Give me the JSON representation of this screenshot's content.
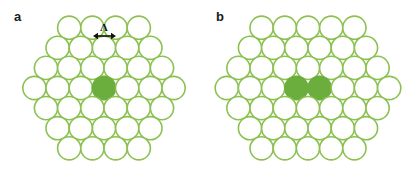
{
  "figure": {
    "background_color": "#ffffff",
    "width": 416,
    "height": 171
  },
  "colors": {
    "circle_outline": "#8CC152",
    "circle_fill_empty": "#ffffff",
    "circle_fill_highlight": "#6CAE3E",
    "label_text": "#1a1a1a",
    "annotation": "#111111"
  },
  "panels": [
    {
      "id": "a",
      "label": "a",
      "lattice": {
        "type": "hexagonal-close-packed",
        "row_counts": [
          4,
          5,
          6,
          7,
          6,
          5,
          4
        ],
        "total_circles": 37,
        "circle_radius": 11.6,
        "spacing": 23.2,
        "center_x": 104,
        "center_y": 88,
        "highlighted": [
          {
            "row": 3,
            "index": 3
          }
        ],
        "highlight_count": 1
      },
      "annotation": {
        "symbol": "Λ",
        "symbol_name": "lattice-spacing-lambda",
        "arrow_type": "double-headed-horizontal",
        "arrow_x_start": 93,
        "arrow_x_end": 116,
        "arrow_y": 36,
        "symbol_x": 104,
        "symbol_y": 31
      }
    },
    {
      "id": "b",
      "label": "b",
      "lattice": {
        "type": "hexagonal-close-packed",
        "row_counts": [
          5,
          6,
          7,
          8,
          7,
          6,
          5
        ],
        "total_circles": 44,
        "circle_radius": 11.6,
        "spacing": 23.2,
        "center_x": 100,
        "center_y": 88,
        "highlighted": [
          {
            "row": 3,
            "index": 3
          },
          {
            "row": 3,
            "index": 4
          }
        ],
        "highlight_count": 2
      },
      "annotation": null
    }
  ]
}
